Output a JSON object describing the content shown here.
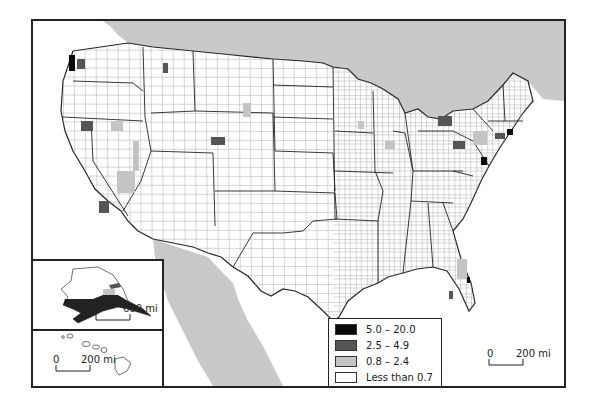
{
  "map": {
    "subject": "United States counties choropleth",
    "colors": {
      "class_1": "#0a0a0a",
      "class_2": "#555555",
      "class_3": "#c4c4c4",
      "class_4": "#ffffff",
      "water_and_foreign": "#c9c9c9",
      "county_border": "#8a8a8a",
      "state_border": "#222222"
    }
  },
  "legend": {
    "items": [
      {
        "label": "5.0 – 20.0",
        "color": "#0a0a0a"
      },
      {
        "label": "2.5 – 4.9",
        "color": "#555555"
      },
      {
        "label": "0.8 – 2.4",
        "color": "#c4c4c4"
      },
      {
        "label": "Less than 0.7",
        "color": "#ffffff"
      }
    ]
  },
  "scales": {
    "main": {
      "zero": "0",
      "distance": "200 mi"
    },
    "alaska": {
      "zero": "0",
      "distance": "600 mi"
    },
    "hawaii": {
      "zero": "0",
      "distance": "200 mi"
    }
  },
  "insets": {
    "alaska": "Alaska",
    "hawaii": "Hawaii"
  }
}
